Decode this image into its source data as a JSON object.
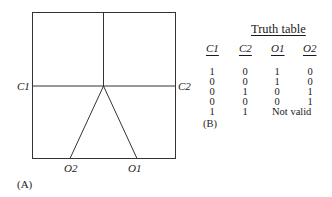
{
  "diagram_a": {
    "label": "(A)",
    "left_label": "C1",
    "right_label": "C2",
    "bottom_labels": [
      "O2",
      "O1"
    ]
  },
  "truth_table": {
    "title": "Truth table",
    "headers": [
      "C1",
      "C2",
      "O1",
      "O2"
    ],
    "rows": [
      [
        "1",
        "0",
        "1",
        "0"
      ],
      [
        "0",
        "0",
        "1",
        "0"
      ],
      [
        "0",
        "1",
        "0",
        "1"
      ],
      [
        "0",
        "0",
        "0",
        "1"
      ],
      [
        "1",
        "1",
        "Not valid",
        ""
      ]
    ],
    "label": "(B)"
  }
}
